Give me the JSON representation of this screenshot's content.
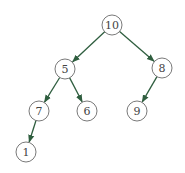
{
  "diagram": {
    "type": "binary-tree",
    "edge_color": "#2f5e3f",
    "node_stroke": "#6a6a6a",
    "node_radius": 10,
    "nodes": [
      {
        "id": "n10",
        "label": "10",
        "x": 112,
        "y": 25
      },
      {
        "id": "n5",
        "label": "5",
        "x": 65,
        "y": 69
      },
      {
        "id": "n8",
        "label": "8",
        "x": 162,
        "y": 68
      },
      {
        "id": "n7",
        "label": "7",
        "x": 39,
        "y": 111
      },
      {
        "id": "n6",
        "label": "6",
        "x": 87,
        "y": 111
      },
      {
        "id": "n9",
        "label": "9",
        "x": 137,
        "y": 111
      },
      {
        "id": "n1",
        "label": "1",
        "x": 26,
        "y": 152
      }
    ],
    "edges": [
      {
        "from": "n10",
        "to": "n5"
      },
      {
        "from": "n10",
        "to": "n8"
      },
      {
        "from": "n5",
        "to": "n7"
      },
      {
        "from": "n5",
        "to": "n6"
      },
      {
        "from": "n8",
        "to": "n9"
      },
      {
        "from": "n7",
        "to": "n1"
      }
    ]
  }
}
